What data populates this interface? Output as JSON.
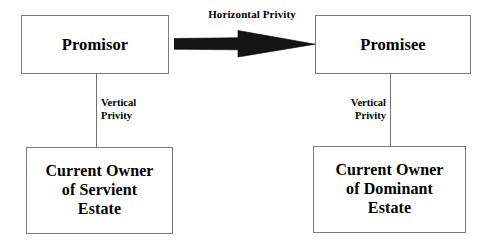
{
  "diagram": {
    "background_color": "#ffffff",
    "text_color": "#000000",
    "box_border_color": "#7a7a7a",
    "connector_color": "#6f6f6f",
    "arrow_color": "#111111"
  },
  "nodes": [
    {
      "id": "promisor",
      "label": "Promisor"
    },
    {
      "id": "promisee",
      "label": "Promisee"
    },
    {
      "id": "servient",
      "label": "Current Owner\nof Servient\nEstate"
    },
    {
      "id": "dominant",
      "label": "Current Owner\nof Dominant\nEstate"
    }
  ],
  "edges": {
    "horizontal": {
      "label": "Horizontal Privity",
      "from": "promisor",
      "to": "promisee",
      "style": "block-arrow",
      "direction": "right"
    },
    "vertical_left": {
      "label": "Vertical\nPrivity",
      "from": "promisor",
      "to": "servient",
      "style": "line"
    },
    "vertical_right": {
      "label": "Vertical\nPrivity",
      "from": "promisee",
      "to": "dominant",
      "style": "line"
    }
  }
}
